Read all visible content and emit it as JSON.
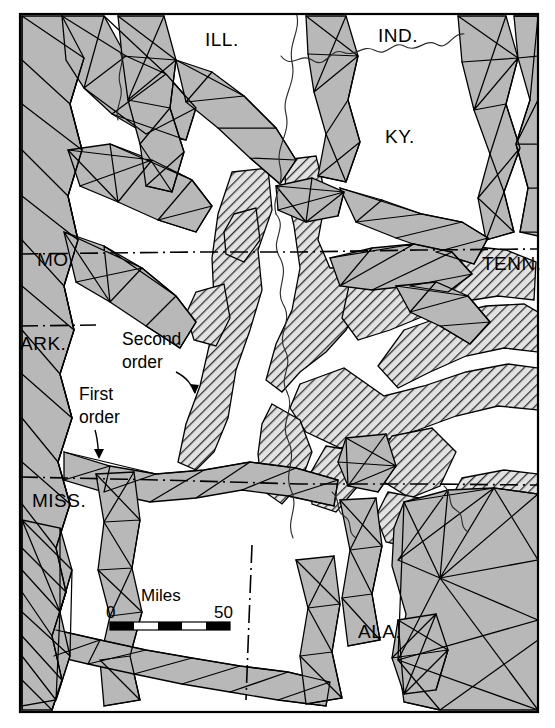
{
  "map": {
    "title": "Seismic network map of the New Madrid / Mississippi Embayment region",
    "frame": {
      "x": 20,
      "y": 14,
      "width": 518,
      "height": 698,
      "stroke": "#000000",
      "stroke_width": 2
    },
    "colors": {
      "first_order_fill": "#b8b8b8",
      "second_order_hatch_stroke": "#3a3a3a",
      "second_order_fill": "#d9d9d9",
      "background": "#ffffff",
      "line": "#000000",
      "river": "#333333",
      "border_dashdot": "#000000"
    },
    "state_labels": [
      {
        "name": "illinois",
        "text": "ILL.",
        "x": 205,
        "y": 46
      },
      {
        "name": "indiana",
        "text": "IND.",
        "x": 378,
        "y": 42
      },
      {
        "name": "kentucky",
        "text": "KY.",
        "x": 385,
        "y": 143
      },
      {
        "name": "missouri",
        "text": "MO.",
        "x": 37,
        "y": 266
      },
      {
        "name": "tennessee",
        "text": "TENN.",
        "x": 482,
        "y": 270
      },
      {
        "name": "arkansas",
        "text": "ARK.",
        "x": 20,
        "y": 350
      },
      {
        "name": "mississippi",
        "text": "MISS.",
        "x": 32,
        "y": 507
      },
      {
        "name": "alabama",
        "text": "ALA.",
        "x": 358,
        "y": 638
      }
    ],
    "annotations": [
      {
        "name": "second-order",
        "line1": "Second",
        "line2": "order",
        "x": 122,
        "y": 345,
        "x2": 122,
        "y2": 368,
        "leader": "M176,374 C188,379 192,386 196,394"
      },
      {
        "name": "first-order",
        "line1": "First",
        "line2": "order",
        "x": 79,
        "y": 400,
        "x2": 79,
        "y2": 423,
        "leader": "M95,430 C98,440 98,448 99,458"
      }
    ],
    "scale_bar": {
      "name": "scale-bar",
      "caption": "Miles",
      "min_label": "0",
      "max_label": "50",
      "caption_x": 168,
      "caption_y": 600,
      "min_x": 110,
      "min_y": 617,
      "max_x": 238,
      "max_y": 617,
      "bar_x": 110,
      "bar_y": 621,
      "bar_width": 120,
      "bar_height": 8,
      "segments": 5
    },
    "legend_keys": [
      {
        "name": "first-order-key",
        "label": "First order",
        "pattern": "triangulated-gray"
      },
      {
        "name": "second-order-key",
        "label": "Second order",
        "pattern": "diagonal-hatch"
      }
    ],
    "borders": [
      {
        "name": "ky-tenn-border",
        "type": "dash-dot",
        "path": "M20,254 L197,252 L300,252 L420,250 L538,249"
      },
      {
        "name": "mo-ark-border",
        "type": "dash-dot",
        "path": "M20,326 L95,325"
      },
      {
        "name": "tenn-miss-ala-border",
        "type": "dash-dot",
        "path": "M20,477 L160,480 L300,484 L420,484 L538,485"
      },
      {
        "name": "miss-ala-border",
        "type": "dash-dot",
        "path": "M252,545 L249,620 L246,700"
      }
    ],
    "rivers": [
      {
        "name": "ohio-river",
        "path": "M281,56 C292,70 300,52 312,60 C326,70 330,48 342,52 C356,58 362,44 374,50 C388,58 392,40 404,46 C418,54 424,38 436,44 C448,52 452,32 464,34"
      },
      {
        "name": "mississippi-river-upper",
        "path": "M296,12 C300,30 290,44 292,62 C296,84 282,96 286,114 C290,134 276,146 280,166 C284,186 272,196 276,214"
      },
      {
        "name": "mississippi-river-mid",
        "path": "M276,214 C288,228 272,240 280,256 C292,276 276,288 284,304 C294,322 278,334 286,350 C294,366 280,378 288,392"
      },
      {
        "name": "mississippi-river-lower",
        "path": "M288,392 C296,410 280,422 288,440 C298,460 284,472 292,490 C300,508 286,520 294,538"
      }
    ]
  }
}
